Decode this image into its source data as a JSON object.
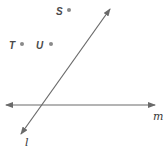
{
  "diagram": {
    "points": [
      {
        "label": "S",
        "x": 69,
        "y": 10
      },
      {
        "label": "T",
        "x": 22,
        "y": 44
      },
      {
        "label": "U",
        "x": 51,
        "y": 44
      }
    ],
    "lines": [
      {
        "label": "l",
        "from": [
          21,
          134
        ],
        "to": [
          110,
          9
        ]
      },
      {
        "label": "m",
        "from": [
          6,
          105
        ],
        "to": [
          155,
          105
        ]
      }
    ],
    "colors": {
      "line": "#6a6a6a",
      "point": "#8a8a8a",
      "text": "#3a3a3a"
    }
  }
}
